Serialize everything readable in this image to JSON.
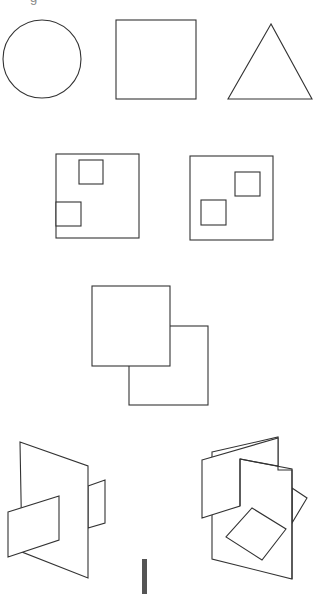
{
  "figure": {
    "caption_partial": "g",
    "stroke_color": "#333333",
    "background": "#ffffff",
    "rows": [
      {
        "name": "basic-shapes",
        "items": [
          {
            "shape": "circle",
            "label": "circle"
          },
          {
            "shape": "square",
            "label": "square"
          },
          {
            "shape": "triangle",
            "label": "triangle"
          }
        ]
      },
      {
        "name": "squares-with-inner-squares",
        "items": [
          {
            "shape": "square-frame",
            "inner_squares": 2,
            "label": "frame with two inner squares (one touching left edge)"
          },
          {
            "shape": "square-frame",
            "inner_squares": 2,
            "label": "frame with two inner squares"
          }
        ]
      },
      {
        "name": "overlapping-squares",
        "items": [
          {
            "shape": "two-overlapping-squares",
            "label": "front square overlapping back square"
          }
        ]
      },
      {
        "name": "3d-planes",
        "items": [
          {
            "shape": "intersecting-planes",
            "count": 3,
            "label": "three intersecting planes"
          },
          {
            "shape": "intersecting-planes",
            "count": 5,
            "label": "multiple intersecting planes with diamond"
          }
        ]
      }
    ],
    "scroll_indicator": {
      "color": "#555555"
    }
  }
}
